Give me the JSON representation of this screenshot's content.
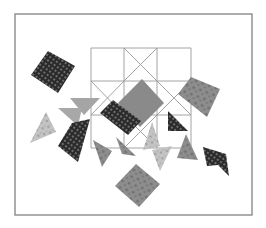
{
  "canvas": {
    "width": 266,
    "height": 228,
    "background": "#ffffff"
  },
  "frame": {
    "x": 15,
    "y": 14,
    "width": 237,
    "height": 201,
    "stroke": "#8a8a8a",
    "stroke_width": 1.4
  },
  "grid": {
    "x": [
      91,
      124,
      157,
      191
    ],
    "y": [
      48,
      81,
      115,
      148
    ],
    "stroke": "#9a9a9a",
    "stroke_width": 0.9,
    "diagonals": [
      [
        124,
        48,
        157,
        81
      ],
      [
        157,
        48,
        124,
        81
      ],
      [
        91,
        81,
        124,
        115
      ],
      [
        124,
        81,
        91,
        115
      ],
      [
        157,
        81,
        191,
        115
      ],
      [
        191,
        81,
        157,
        115
      ],
      [
        124,
        115,
        157,
        148
      ],
      [
        157,
        115,
        124,
        148
      ]
    ]
  },
  "patterns": {
    "dark_dots": {
      "base": "#2a2a2a",
      "dot": "#8c8c8c"
    },
    "mottled": {
      "base": "#8e8e8e",
      "spot": "#5a5a5a"
    },
    "light_floral": {
      "base": "#c4c4c4",
      "spot": "#7e7e7e"
    }
  },
  "pieces": [
    {
      "name": "dark-dotted-square-topleft",
      "points": "31,75 48,51 75,66 58,93",
      "fill": "dark_dots"
    },
    {
      "name": "large-gray-square-center",
      "points": "118,103 142,79 164,103 140,127",
      "fill": "#8a8a8a"
    },
    {
      "name": "dark-dotted-square-center",
      "points": "100,113 113,100 141,121 128,135",
      "fill": "dark_dots"
    },
    {
      "name": "mottled-square-right",
      "points": "178,94 191,77 220,89 207,117",
      "fill": "mottled"
    },
    {
      "name": "dark-dotted-triangle-right-in-grid",
      "points": "168,111 168,131 188,131",
      "fill": "dark_dots"
    },
    {
      "name": "light-gray-triangle-top",
      "points": "70,98 100,98 84,115",
      "fill": "#a5a5a5"
    },
    {
      "name": "light-gray-triangle-middle",
      "points": "58,108 82,108 78,126",
      "fill": "#a8a8a8"
    },
    {
      "name": "floral-triangle-left",
      "points": "30,143 46,112 56,132",
      "fill": "light_floral"
    },
    {
      "name": "dark-dotted-trapezoid-left",
      "points": "58,146 72,123 90,119 78,162",
      "fill": "dark_dots"
    },
    {
      "name": "mottled-triangle-below-grid-1",
      "points": "93,140 112,151 102,167",
      "fill": "mottled"
    },
    {
      "name": "mottled-triangle-below-grid-2",
      "points": "116,137 122,154 136,156",
      "fill": "mottled"
    },
    {
      "name": "floral-triangle-grid-bottom",
      "points": "143,150 152,122 160,146",
      "fill": "light_floral"
    },
    {
      "name": "light-mottled-triangle-bottom",
      "points": "152,150 172,146 160,171",
      "fill": "light_floral"
    },
    {
      "name": "mottled-triangle-bottom-right",
      "points": "177,158 186,134 198,160",
      "fill": "mottled"
    },
    {
      "name": "dark-dotted-bowtie-right",
      "points": "203,147 226,154 229,176 218,165 207,166",
      "fill": "dark_dots"
    },
    {
      "name": "mottled-square-bottom",
      "points": "115,186 136,164 160,184 139,207",
      "fill": "mottled"
    }
  ]
}
